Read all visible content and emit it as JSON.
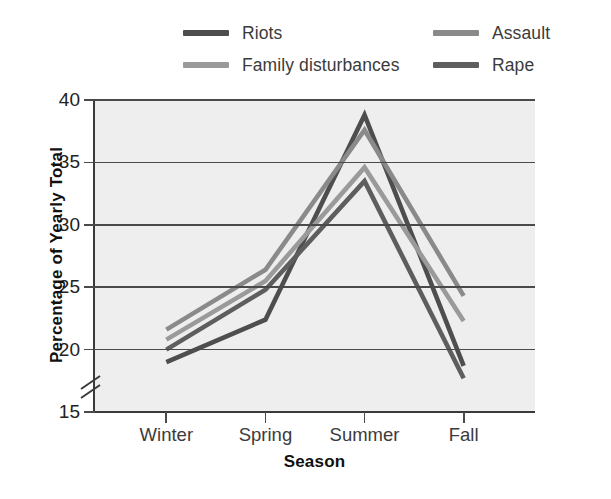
{
  "chart_data": {
    "type": "line",
    "title": "",
    "xlabel": "Season",
    "ylabel": "Percentage of Yearly Total",
    "categories": [
      "Winter",
      "Spring",
      "Summer",
      "Fall"
    ],
    "ylim": [
      15,
      40
    ],
    "yticks": [
      15,
      20,
      25,
      30,
      35,
      40
    ],
    "grid": true,
    "axis_break": true,
    "legend_position": "top",
    "series": [
      {
        "name": "Riots",
        "color": "#4e4e4e",
        "values": [
          19.0,
          22.4,
          38.8,
          18.7
        ]
      },
      {
        "name": "Assault",
        "color": "#8a8a8a",
        "values": [
          21.6,
          26.4,
          37.6,
          24.3
        ]
      },
      {
        "name": "Family disturbances",
        "color": "#9a9a9a",
        "values": [
          20.8,
          25.5,
          34.6,
          22.3
        ]
      },
      {
        "name": "Rape",
        "color": "#5e5e5e",
        "values": [
          20.0,
          24.8,
          33.5,
          17.7
        ]
      }
    ]
  },
  "legend": {
    "items": [
      {
        "label": "Riots",
        "color": "#4e4e4e",
        "row": 1,
        "col": "left"
      },
      {
        "label": "Assault",
        "color": "#8a8a8a",
        "row": 1,
        "col": "right"
      },
      {
        "label": "Family disturbances",
        "color": "#9a9a9a",
        "row": 2,
        "col": "left"
      },
      {
        "label": "Rape",
        "color": "#5e5e5e",
        "row": 2,
        "col": "right"
      }
    ]
  },
  "axes": {
    "y_tick_labels": [
      "40",
      "35",
      "30",
      "25",
      "20",
      "15"
    ],
    "x_tick_labels": [
      "Winter",
      "Spring",
      "Summer",
      "Fall"
    ],
    "x_title": "Season",
    "y_title": "Percentage of Yearly Total"
  },
  "colors": {
    "plot_background": "#eeeeee",
    "gridline": "#4a4a4a",
    "axis": "#3a3a3a",
    "text": "#222222"
  }
}
